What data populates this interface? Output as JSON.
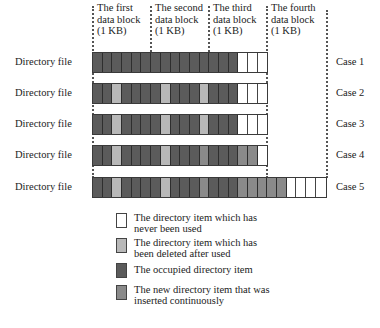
{
  "block_headers": [
    {
      "line1": "The first",
      "line2": "data block",
      "line3": "(1 KB)"
    },
    {
      "line1": "The second",
      "line2": "data block",
      "line3": "(1 KB)"
    },
    {
      "line1": "The third",
      "line2": "data block",
      "line3": "(1 KB)"
    },
    {
      "line1": "The fourth",
      "line2": "data block",
      "line3": "(1 KB)"
    }
  ],
  "rows": [
    {
      "label": "Directory file",
      "case": "Case 1",
      "cells": "OOOOOOOOOOOOOOOUUU"
    },
    {
      "label": "Directory file",
      "case": "Case 2",
      "cells": "OODOOOODOOODOOOUUU"
    },
    {
      "label": "Directory file",
      "case": "Case 3",
      "cells": "OODOOOODOOODOOOUUU"
    },
    {
      "label": "Directory file",
      "case": "Case 4",
      "cells": "OODOOOODOOONOOONNU"
    },
    {
      "label": "Directory file",
      "case": "Case 5",
      "cells": "OODOOOODOOONOOONNNNNUUUU"
    }
  ],
  "legend": [
    {
      "key": "U",
      "line1": "The directory item which has",
      "line2": "never been used",
      "color": "#ffffff"
    },
    {
      "key": "D",
      "line1": "The directory item which has",
      "line2": "been deleted after used",
      "color": "#b8b8b8"
    },
    {
      "key": "O",
      "line1": "The occupied directory item",
      "line2": "",
      "color": "#5b5b5b"
    },
    {
      "key": "N",
      "line1": "The new directory item that was",
      "line2": "inserted continuously",
      "color": "#8a8a8a"
    }
  ]
}
